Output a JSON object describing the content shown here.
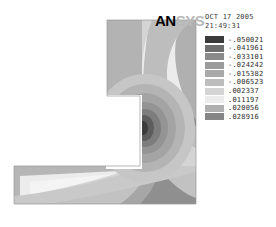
{
  "window": {
    "title": "ANSYS Contour Plot",
    "background": "#ffffff"
  },
  "logo": {
    "name": "ansys-logo",
    "part_dark": "AN",
    "part_light": "SYS",
    "color_dark": "#000000",
    "color_light": "#b9b9b9"
  },
  "stamp": {
    "date": "OCT 17 2005",
    "time": "21:49:31"
  },
  "chart_data": {
    "type": "heatmap",
    "title": "",
    "subtitle": "",
    "xlabel": "",
    "ylabel": "",
    "legend_position": "right",
    "grid": false,
    "geometry": "L-shaped bracket (vertical arm + horizontal arm), re-entrant inner corner",
    "stress_concentration_center": {
      "x": 143,
      "y": 128
    },
    "categories": [
      "-.050021",
      "-.041961",
      "-.033101",
      "-.024242",
      "-.015382",
      "-.006523",
      ".002337",
      ".011197",
      ".020056",
      ".028916"
    ],
    "values": [
      -0.050021,
      -0.041961,
      -0.033101,
      -0.024242,
      -0.015382,
      -0.006523,
      0.002337,
      0.011197,
      0.020056,
      0.028916
    ],
    "colors": [
      "#3b3b3b",
      "#6e6e6e",
      "#8a8a8a",
      "#9b9b9b",
      "#a9a9a9",
      "#bdbdbd",
      "#d4d4d4",
      "#ececec",
      "#b0b0b0",
      "#868686"
    ],
    "band_count": 10,
    "band_step": 0.00886,
    "value_range": [
      -0.050021,
      0.028916
    ]
  },
  "legend": {
    "name": "contour-legend",
    "entries": [
      {
        "label": "-.050021",
        "color": "#3b3b3b"
      },
      {
        "label": "-.041961",
        "color": "#6e6e6e"
      },
      {
        "label": "-.033101",
        "color": "#8a8a8a"
      },
      {
        "label": "-.024242",
        "color": "#9b9b9b"
      },
      {
        "label": "-.015382",
        "color": "#a9a9a9"
      },
      {
        "label": "-.006523",
        "color": "#bdbdbd"
      },
      {
        "label": ".002337",
        "color": "#d4d4d4"
      },
      {
        "label": ".011197",
        "color": "#ececec"
      },
      {
        "label": ".020056",
        "color": "#b0b0b0"
      },
      {
        "label": ".028916",
        "color": "#868686"
      }
    ]
  }
}
